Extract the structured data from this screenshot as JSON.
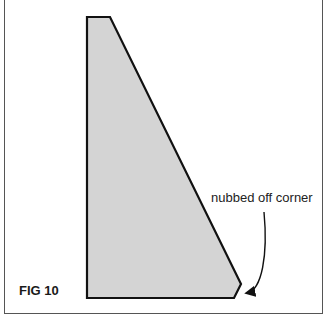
{
  "figure": {
    "label": "FIG 10",
    "annotation": "nubbed off corner",
    "shape": {
      "type": "polygon",
      "description": "tapered wedge with nubbed-off bottom-right corner",
      "fill": "#d4d4d4",
      "stroke": "#111111",
      "points": [
        [
          87,
          17
        ],
        [
          110,
          17
        ],
        [
          241,
          284
        ],
        [
          234,
          298
        ],
        [
          87,
          298
        ]
      ]
    },
    "arrow": {
      "from": [
        264,
        212
      ],
      "to": [
        245,
        293
      ],
      "color": "#111111"
    },
    "frame_color": "#555555"
  }
}
